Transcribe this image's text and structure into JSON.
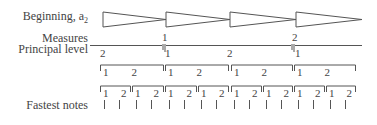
{
  "labels": {
    "beginning": "Beginning, a",
    "beginning_sub": "2",
    "measures": "Measures",
    "principal": "Principal level",
    "fastest": "Fastest notes"
  },
  "colors": {
    "ink": "#444444",
    "line": "#555555",
    "background": "#ffffff"
  },
  "triangles": [
    {
      "x1": 103,
      "x2": 166
    },
    {
      "x1": 166,
      "x2": 230
    },
    {
      "x1": 230,
      "x2": 296
    },
    {
      "x1": 296,
      "x2": 362
    }
  ],
  "measures": [
    {
      "x": 165,
      "text": "1"
    },
    {
      "x": 295,
      "text": "2"
    }
  ],
  "principal": {
    "segments": [
      {
        "x1": 90,
        "x2": 162
      },
      {
        "x1": 166,
        "x2": 291
      },
      {
        "x1": 295,
        "x2": 362
      }
    ],
    "numbers": [
      {
        "x": 103,
        "text": "2"
      },
      {
        "x": 168,
        "text": "1"
      },
      {
        "x": 230,
        "text": "2"
      },
      {
        "x": 298,
        "text": "1"
      }
    ]
  },
  "level2": [
    {
      "x1": 100,
      "x2": 163,
      "a": "1",
      "b": "2"
    },
    {
      "x1": 165,
      "x2": 228,
      "a": "1",
      "b": "2"
    },
    {
      "x1": 231,
      "x2": 292,
      "a": "1",
      "b": "2"
    },
    {
      "x1": 294,
      "x2": 355,
      "a": "1",
      "b": "2"
    }
  ],
  "level3": [
    {
      "x1": 100,
      "x2": 130,
      "a": "1",
      "b": "2"
    },
    {
      "x1": 132,
      "x2": 163,
      "a": "1",
      "b": "2"
    },
    {
      "x1": 165,
      "x2": 196,
      "a": "1",
      "b": "2"
    },
    {
      "x1": 198,
      "x2": 228,
      "a": "1",
      "b": "2"
    },
    {
      "x1": 231,
      "x2": 261,
      "a": "1",
      "b": "2"
    },
    {
      "x1": 263,
      "x2": 292,
      "a": "1",
      "b": "2"
    },
    {
      "x1": 294,
      "x2": 324,
      "a": "1",
      "b": "2"
    },
    {
      "x1": 326,
      "x2": 355,
      "a": "1",
      "b": "2"
    }
  ],
  "ticks": [
    104,
    119,
    136,
    151,
    169,
    184,
    201,
    216,
    234,
    249,
    266,
    281,
    298,
    313,
    330,
    345
  ]
}
